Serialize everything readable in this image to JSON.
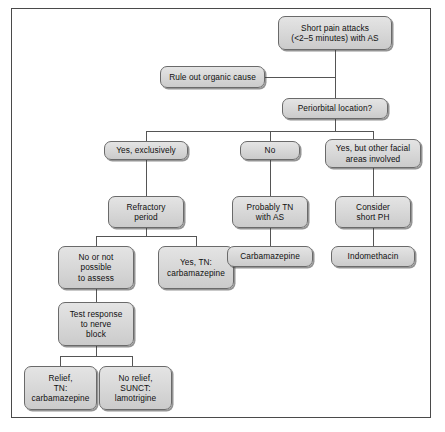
{
  "figure": {
    "type": "clinical-decision-flowchart",
    "border_color": "#4a4a4a",
    "node_fill": "#d9d9d9",
    "node_border": "#6a6a6a",
    "connector_color": "#555555",
    "background": "#ffffff"
  },
  "nodes": {
    "start": "Short pain attacks\n(<2–5 minutes) with AS",
    "rule_out": "Rule out organic cause",
    "periorbital": "Periorbital location?",
    "yes_exclusively": "Yes, exclusively",
    "no": "No",
    "yes_other_facial": "Yes, but other facial\nareas involved",
    "refractory_period": "Refractory\nperiod",
    "probably_tn": "Probably TN\nwith AS",
    "consider_short_ph": "Consider\nshort PH",
    "no_or_not_possible": "No or not\npossible\nto assess",
    "yes_tn_carbamazepine": "Yes, TN:\ncarbamazepine",
    "carbamazepine": "Carbamazepine",
    "indomethacin": "Indomethacin",
    "test_response": "Test response\nto nerve\nblock",
    "relief_tn": "Relief,\nTN:\ncarbamazepine",
    "no_relief_sunct": "No relief,\nSUNCT:\nlamotrigine"
  }
}
